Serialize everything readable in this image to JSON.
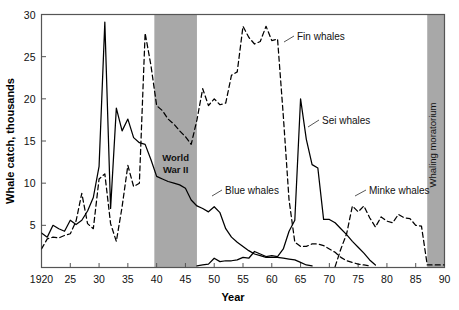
{
  "chart_data": {
    "type": "line",
    "title": "",
    "xlabel": "Year",
    "ylabel": "Whale catch, thousands",
    "xlim": [
      1920,
      1990
    ],
    "ylim": [
      0,
      30
    ],
    "xticks": [
      1920,
      1925,
      1930,
      1935,
      1940,
      1945,
      1950,
      1955,
      1960,
      1965,
      1970,
      1975,
      1980,
      1985,
      1990
    ],
    "xtick_labels": [
      "1920",
      "25",
      "30",
      "35",
      "40",
      "45",
      "50",
      "55",
      "60",
      "65",
      "70",
      "75",
      "80",
      "85",
      "90"
    ],
    "yticks": [
      5,
      10,
      15,
      20,
      25,
      30
    ],
    "ytick_labels": [
      "5",
      "10",
      "15",
      "20",
      "25",
      "30"
    ],
    "grid": false,
    "legend_position": "inline-annotations",
    "series": [
      {
        "name": "Blue whales",
        "style": "solid",
        "color": "#000000",
        "x": [
          1920,
          1921,
          1922,
          1923,
          1924,
          1925,
          1926,
          1927,
          1928,
          1929,
          1930,
          1931,
          1932,
          1933,
          1934,
          1935,
          1936,
          1937,
          1938,
          1939,
          1940,
          1941,
          1942,
          1943,
          1944,
          1945,
          1946,
          1947,
          1948,
          1949,
          1950,
          1951,
          1952,
          1953,
          1954,
          1955,
          1956,
          1957,
          1958,
          1959,
          1960,
          1961,
          1962,
          1963,
          1964,
          1965,
          1966,
          1967
        ],
        "values": [
          4.1,
          3.6,
          5.0,
          4.6,
          4.3,
          5.6,
          5.1,
          5.6,
          6.7,
          8.3,
          12.0,
          29.1,
          7.0,
          18.9,
          16.2,
          17.6,
          15.4,
          14.8,
          14.6,
          12.8,
          10.8,
          10.5,
          10.2,
          10.0,
          9.8,
          9.4,
          8.0,
          7.3,
          7.0,
          6.6,
          7.2,
          6.5,
          4.6,
          3.6,
          3.0,
          2.5,
          2.0,
          1.6,
          1.4,
          1.2,
          1.2,
          1.2,
          1.1,
          1.0,
          0.9,
          0.6,
          0.3,
          0.2
        ]
      },
      {
        "name": "Fin whales",
        "style": "dashed",
        "color": "#000000",
        "x": [
          1920,
          1921,
          1922,
          1923,
          1924,
          1925,
          1926,
          1927,
          1928,
          1929,
          1930,
          1931,
          1932,
          1933,
          1934,
          1935,
          1936,
          1937,
          1938,
          1939,
          1940,
          1941,
          1942,
          1943,
          1944,
          1945,
          1946,
          1947,
          1948,
          1949,
          1950,
          1951,
          1952,
          1953,
          1954,
          1955,
          1956,
          1957,
          1958,
          1959,
          1960,
          1961,
          1962,
          1963,
          1964,
          1965,
          1966,
          1967,
          1968,
          1969,
          1970,
          1971,
          1972,
          1973,
          1974,
          1975,
          1976,
          1977
        ],
        "values": [
          2.2,
          3.4,
          3.6,
          3.5,
          3.8,
          4.0,
          5.5,
          8.8,
          5.2,
          4.6,
          10.5,
          11.1,
          5.2,
          3.1,
          7.2,
          12.1,
          9.6,
          10.0,
          27.8,
          24.0,
          19.2,
          18.6,
          17.6,
          17.0,
          16.2,
          15.5,
          14.6,
          17.5,
          21.2,
          19.2,
          20.0,
          19.3,
          19.5,
          22.8,
          23.2,
          28.6,
          27.3,
          26.5,
          26.8,
          28.6,
          26.9,
          27.1,
          18.0,
          8.0,
          3.0,
          2.5,
          2.5,
          2.8,
          2.8,
          2.6,
          2.2,
          1.8,
          1.2,
          0.8,
          0.6,
          0.4,
          0.3,
          0.2
        ]
      },
      {
        "name": "Sei whales",
        "style": "solid",
        "color": "#000000",
        "x": [
          1947,
          1948,
          1949,
          1950,
          1951,
          1952,
          1953,
          1954,
          1955,
          1956,
          1957,
          1958,
          1959,
          1960,
          1961,
          1962,
          1963,
          1964,
          1965,
          1966,
          1967,
          1968,
          1969,
          1970,
          1971,
          1972,
          1973,
          1974,
          1975,
          1976,
          1977,
          1978
        ],
        "values": [
          0.2,
          0.3,
          0.4,
          1.1,
          0.7,
          0.8,
          0.8,
          0.9,
          1.2,
          1.1,
          1.9,
          1.6,
          1.3,
          1.4,
          1.3,
          2.2,
          4.3,
          5.6,
          20.0,
          15.2,
          12.2,
          11.8,
          5.7,
          5.7,
          5.3,
          4.6,
          3.9,
          3.1,
          2.4,
          1.7,
          0.9,
          0.3
        ]
      },
      {
        "name": "Minke whales",
        "style": "dashed",
        "color": "#000000",
        "x": [
          1971,
          1972,
          1973,
          1974,
          1975,
          1976,
          1977,
          1978,
          1979,
          1980,
          1981,
          1982,
          1983,
          1984,
          1985,
          1986,
          1987,
          1988,
          1989,
          1990
        ],
        "values": [
          0.1,
          2.2,
          4.0,
          7.3,
          6.6,
          7.3,
          5.9,
          4.8,
          6.0,
          5.5,
          5.3,
          6.3,
          5.9,
          5.8,
          5.0,
          4.9,
          0.3,
          0.3,
          0.3,
          0.3
        ]
      }
    ],
    "annotations": [
      {
        "text": "Fin whales",
        "x": 1962,
        "y": 25.3
      },
      {
        "text": "Sei whales",
        "x": 1969,
        "y": 18.3
      },
      {
        "text": "Blue whales",
        "x": 1951,
        "y": 8.0
      },
      {
        "text": "Minke whales",
        "x": 1978,
        "y": 8.0
      }
    ],
    "bands": [
      {
        "label": "World War II",
        "label_lines": [
          "World",
          "War II"
        ],
        "x_start": 1939.6,
        "x_end": 1947.0,
        "color": "#a8a8a8",
        "orientation": "horizontal"
      },
      {
        "label": "Whaling moratorium",
        "label_lines": [
          "Whaling moratorium"
        ],
        "x_start": 1987.0,
        "x_end": 1990.0,
        "color": "#a8a8a8",
        "orientation": "vertical"
      }
    ]
  }
}
